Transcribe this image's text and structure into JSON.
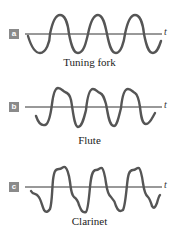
{
  "figure": {
    "panels": [
      {
        "tag": "a",
        "caption": "Tuning fork",
        "axis_label": "t",
        "waveform": "pure sine"
      },
      {
        "tag": "b",
        "caption": "Flute",
        "axis_label": "t",
        "waveform": "sine with small overtone bumps"
      },
      {
        "tag": "c",
        "caption": "Clarinet",
        "axis_label": "t",
        "waveform": "complex with strong overtones"
      }
    ],
    "colors": {
      "wave": "#555555",
      "axis": "#333333",
      "tag_bg": "#8a8a8a"
    }
  }
}
